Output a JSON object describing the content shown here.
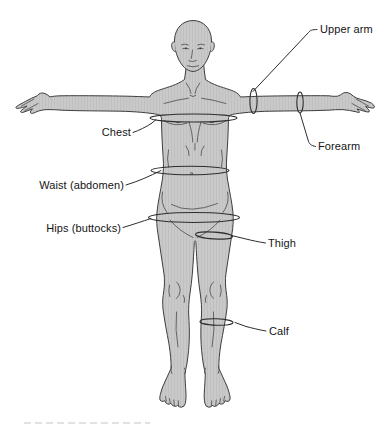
{
  "canvas": {
    "width": 384,
    "height": 425,
    "background": "#ffffff"
  },
  "figure": {
    "style": "line illustration with gray halftone fill",
    "colors": {
      "body_fill": "#c9c9c9",
      "body_texture_line": "#c0c0c0",
      "outline": "#3e3e3e",
      "detail_line": "#4a4a4a",
      "band_line": "#2d2d2d",
      "leader_line": "#2d2d2d",
      "label_text": "#141414",
      "background": "#ffffff"
    }
  },
  "annotations": [
    {
      "id": "upper-arm",
      "text": "Upper arm",
      "side": "right"
    },
    {
      "id": "chest",
      "text": "Chest",
      "side": "left"
    },
    {
      "id": "forearm",
      "text": "Forearm",
      "side": "right"
    },
    {
      "id": "waist",
      "text": "Waist (abdomen)",
      "side": "left"
    },
    {
      "id": "hips",
      "text": "Hips (buttocks)",
      "side": "left"
    },
    {
      "id": "thigh",
      "text": "Thigh",
      "side": "right"
    },
    {
      "id": "calf",
      "text": "Calf",
      "side": "right"
    }
  ],
  "measurement_sites": [
    "chest",
    "waist",
    "hips",
    "upper arm",
    "forearm",
    "thigh",
    "calf"
  ]
}
